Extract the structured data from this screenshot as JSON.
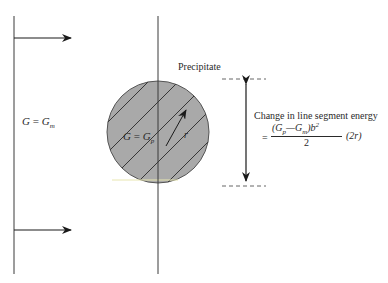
{
  "diagram": {
    "type": "physics-schematic",
    "labels": {
      "matrix": {
        "lhs": "G",
        "eq": " = ",
        "rhs": "G",
        "sub": "m"
      },
      "precipitate_modulus": {
        "lhs": "G",
        "eq": " = ",
        "rhs": "G",
        "sub": "p"
      },
      "precipitate": "Precipitate",
      "radius": "r",
      "energy_title": "Change in line segment energy",
      "formula": {
        "prefix": "=",
        "numerator_open": "(G",
        "sub_p": "p",
        "minus": "—G",
        "sub_m": "m",
        "close_b": ")b",
        "sup_2": "2",
        "denominator": "2",
        "suffix": "(2r)"
      }
    },
    "colors": {
      "line": "#3a3a3a",
      "precipitate_fill": "#a9a9a9",
      "hatch": "#2a2a2a",
      "background": "#ffffff"
    }
  }
}
